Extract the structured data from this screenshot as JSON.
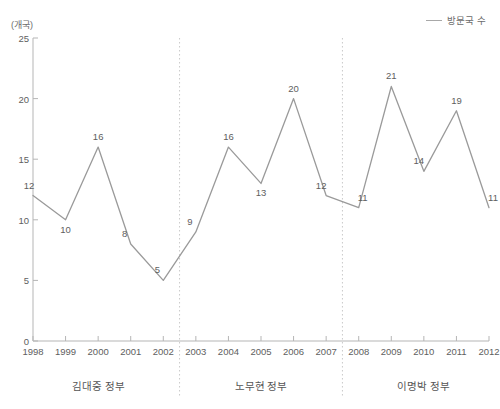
{
  "caption": {
    "cropped_top_text": ""
  },
  "legend": {
    "label": "방문국 수",
    "line_color": "#a8a8a8",
    "position": "top-right"
  },
  "axis": {
    "y_unit": "(개국)",
    "y_ticks": [
      "0",
      "5",
      "10",
      "15",
      "20",
      "25"
    ],
    "x_ticks": [
      "1998",
      "1999",
      "2000",
      "2001",
      "2002",
      "2003",
      "2004",
      "2005",
      "2006",
      "2007",
      "2008",
      "2009",
      "2010",
      "2011",
      "2012"
    ]
  },
  "periods": [
    {
      "label": "김대중 정부",
      "start_year": 1998,
      "end_year": 2002
    },
    {
      "label": "노무현 정부",
      "start_year": 2003,
      "end_year": 2007
    },
    {
      "label": "이명박 정부",
      "start_year": 2008,
      "end_year": 2012
    }
  ],
  "dividers": [
    2002.5,
    2007.5
  ],
  "chart_data": {
    "type": "line",
    "title": "",
    "subtitle": "",
    "xlabel": "",
    "ylabel": "개국",
    "ylim": [
      0,
      25
    ],
    "xlim": [
      1998,
      2012
    ],
    "grid": false,
    "legend_position": "top-right",
    "categories": [
      1998,
      1999,
      2000,
      2001,
      2002,
      2003,
      2004,
      2005,
      2006,
      2007,
      2008,
      2009,
      2010,
      2011,
      2012
    ],
    "series": [
      {
        "name": "방문국 수",
        "color": "#9a9a9a",
        "values": [
          12,
          10,
          16,
          8,
          5,
          9,
          16,
          13,
          20,
          12,
          11,
          21,
          14,
          19,
          11
        ]
      }
    ],
    "point_labels": [
      "12",
      "10",
      "16",
      "8",
      "5",
      "9",
      "16",
      "13",
      "20",
      "12",
      "11",
      "21",
      "14",
      "19",
      "11"
    ],
    "annotations": [
      {
        "text": "김대중 정부",
        "span": [
          1998,
          2002
        ]
      },
      {
        "text": "노무현 정부",
        "span": [
          2003,
          2007
        ]
      },
      {
        "text": "이명박 정부",
        "span": [
          2008,
          2012
        ]
      }
    ]
  }
}
